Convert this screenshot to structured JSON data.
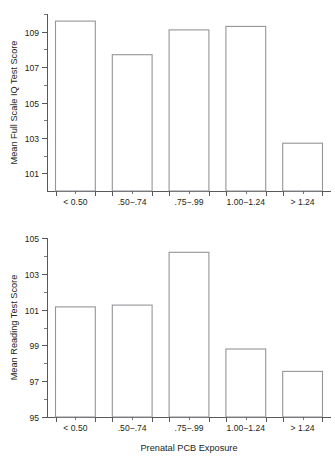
{
  "figure": {
    "x_axis_title": "Prenatal PCB Exposure",
    "categories": [
      "< 0.50",
      ".50−.74",
      ".75−.99",
      "1.00−1.24",
      "> 1.24"
    ],
    "bar_stroke_color": "#939598",
    "axis_color": "#58585b",
    "text_color": "#231f20",
    "background_color": "#ffffff"
  },
  "panels": [
    {
      "id": "panel-iq",
      "ylabel": "Mean Full Scale IQ Test Score",
      "ytick_labels": [
        "101",
        "103",
        "105",
        "107",
        "109"
      ],
      "ytick_values": [
        101,
        103,
        105,
        107,
        109
      ],
      "xtick_labels": [
        "< 0.50",
        ".50−.74",
        ".75−.99",
        "1.00−1.24",
        "> 1.24"
      ]
    },
    {
      "id": "panel-reading",
      "ylabel": "Mean Reading Test Score",
      "ytick_labels": [
        "95",
        "97",
        "99",
        "101",
        "103",
        "105"
      ],
      "ytick_values": [
        95,
        97,
        99,
        101,
        103,
        105
      ],
      "xtick_labels": [
        "< 0.50",
        ".50−.74",
        ".75−.99",
        "1.00−1.24",
        "> 1.24"
      ]
    }
  ],
  "chart_data": [
    {
      "type": "bar",
      "title": "",
      "xlabel": "",
      "ylabel": "Mean Full Scale IQ Test Score",
      "categories": [
        "< 0.50",
        ".50−.74",
        ".75−.99",
        "1.00−1.24",
        "> 1.24"
      ],
      "values": [
        109.6,
        107.7,
        109.1,
        109.3,
        102.7
      ],
      "ylim": [
        100.0,
        110.0
      ],
      "yticks": [
        101,
        103,
        105,
        107,
        109
      ],
      "yminor_ticks": [
        102,
        104,
        106,
        108,
        110
      ],
      "grid": false,
      "legend": "none"
    },
    {
      "type": "bar",
      "title": "",
      "xlabel": "Prenatal PCB Exposure",
      "ylabel": "Mean Reading Test Score",
      "categories": [
        "< 0.50",
        ".50−.74",
        ".75−.99",
        "1.00−1.24",
        "> 1.24"
      ],
      "values": [
        101.15,
        101.25,
        104.2,
        98.8,
        97.55
      ],
      "ylim": [
        95.0,
        105.0
      ],
      "yticks": [
        95,
        97,
        99,
        101,
        103,
        105
      ],
      "yminor_ticks": [
        96,
        98,
        100,
        102,
        104
      ],
      "grid": false,
      "legend": "none"
    }
  ]
}
